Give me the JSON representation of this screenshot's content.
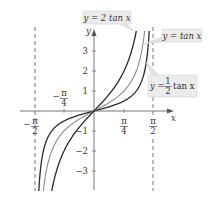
{
  "chart_data": {
    "type": "line",
    "title": "",
    "xlabel": "x",
    "ylabel": "y",
    "xlim": [
      -1.5708,
      1.5708
    ],
    "ylim": [
      -4,
      4
    ],
    "x_ticks": [
      {
        "value": -1.5708,
        "label": "-π/2"
      },
      {
        "value": -0.7854,
        "label": "-π/4"
      },
      {
        "value": 0.7854,
        "label": "π/4"
      },
      {
        "value": 1.5708,
        "label": "π/2"
      }
    ],
    "y_ticks": [
      -3,
      -2,
      -1,
      1,
      2,
      3
    ],
    "asymptotes": [
      "x = -π/2",
      "x = π/2"
    ],
    "grid": false,
    "series": [
      {
        "name": "y = 2 tan x",
        "expression": "2*tan(x)",
        "color": "#2a2a2a"
      },
      {
        "name": "y = tan x",
        "expression": "tan(x)",
        "color": "#8a8a8a"
      },
      {
        "name": "y = ½ tan x",
        "expression": "0.5*tan(x)",
        "color": "#2a2a2a"
      }
    ],
    "annotations": [
      {
        "text": "y = 2 tan x",
        "points_to": "y = 2 tan x"
      },
      {
        "text": "y = tan x",
        "points_to": "y = tan x"
      },
      {
        "text": "y = ½ tan x",
        "points_to": "y = ½ tan x"
      }
    ]
  },
  "labels": {
    "x_axis": "x",
    "y_axis": "y",
    "y_ticks": [
      "3",
      "2",
      "1",
      "−1",
      "−2",
      "−3"
    ],
    "neg_pi_4_num": "π",
    "neg_pi_4_den": "4",
    "neg_pi_2_num": "π",
    "neg_pi_2_den": "2",
    "pi_4_num": "π",
    "pi_4_den": "4",
    "pi_2_num": "π",
    "pi_2_den": "2",
    "minus": "−",
    "ann_2tan": "y = 2 tan x",
    "ann_tan": "y = tan x",
    "ann_half_y": "y =",
    "ann_half_num": "1",
    "ann_half_den": "2",
    "ann_half_rest": "tan x"
  }
}
